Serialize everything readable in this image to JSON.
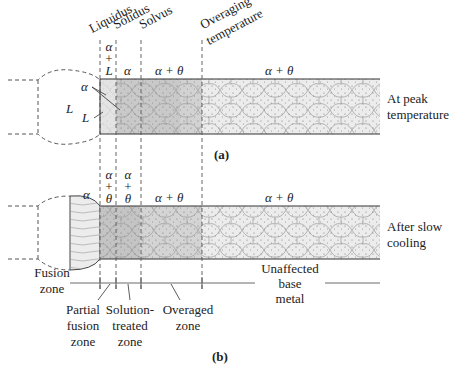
{
  "diagram": {
    "panel_a": {
      "caption": "(a)",
      "condition": [
        "At peak",
        "temperature"
      ],
      "boundaries": [
        "Liquidus",
        "Solidus",
        "Solvus",
        "Overaging",
        "temperature"
      ],
      "phases": {
        "alpha_L_stack": [
          "α",
          "+",
          "L"
        ],
        "alpha": "α",
        "alpha_theta_1": "α + θ",
        "alpha_theta_2": "α + θ",
        "pool_L": "L",
        "pool_alpha_pointer": "α",
        "pool_L_pointer": "L"
      }
    },
    "panel_b": {
      "caption": "(b)",
      "condition": [
        "After slow",
        "cooling"
      ],
      "phases": {
        "fusion_alpha": "α",
        "stack1": [
          "α",
          "+",
          "θ"
        ],
        "stack2": [
          "α",
          "+",
          "θ"
        ],
        "alpha_theta_1": "α + θ",
        "alpha_theta_2": "α + θ"
      },
      "zones": {
        "fusion": [
          "Fusion",
          "zone"
        ],
        "partial_fusion": [
          "Partial",
          "fusion",
          "zone"
        ],
        "solution_treated": [
          "Solution-",
          "treated",
          "zone"
        ],
        "overaged": [
          "Overaged",
          "zone"
        ],
        "unaffected": [
          "Unaffected",
          "base",
          "metal"
        ]
      }
    },
    "colors": {
      "grain_dark": "#c9c9c9",
      "grain_mid": "#d8d8d8",
      "grain_light": "#ececec",
      "line": "#333333"
    }
  }
}
